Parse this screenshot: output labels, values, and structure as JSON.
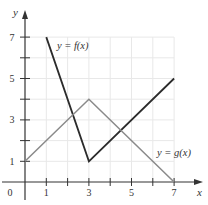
{
  "chart_data": {
    "type": "line",
    "title": "",
    "xlabel": "x",
    "ylabel": "y",
    "xlim": [
      0,
      7
    ],
    "ylim": [
      0,
      7
    ],
    "grid": true,
    "x_ticks": [
      0,
      1,
      2,
      3,
      4,
      5,
      6,
      7
    ],
    "x_tick_labels": [
      "0",
      "1",
      "",
      "3",
      "",
      "5",
      "",
      "7"
    ],
    "y_ticks": [
      1,
      2,
      3,
      4,
      5,
      6,
      7
    ],
    "y_tick_labels": [
      "1",
      "",
      "3",
      "",
      "5",
      "",
      "7"
    ],
    "series": [
      {
        "name": "y = f(x)",
        "color": "#2b2b2b",
        "points": [
          [
            1,
            7
          ],
          [
            3,
            1
          ],
          [
            7,
            5
          ]
        ],
        "label_position": [
          1.5,
          6.55
        ]
      },
      {
        "name": "y = g(x)",
        "color": "#8a8a8a",
        "points": [
          [
            0,
            1
          ],
          [
            3,
            4
          ],
          [
            7,
            0
          ]
        ],
        "label_position": [
          6.2,
          1.4
        ]
      }
    ],
    "legend": "inline labels"
  },
  "colors": {
    "axis": "#333333",
    "grid": "#e8e8e8",
    "background": "#ffffff"
  }
}
